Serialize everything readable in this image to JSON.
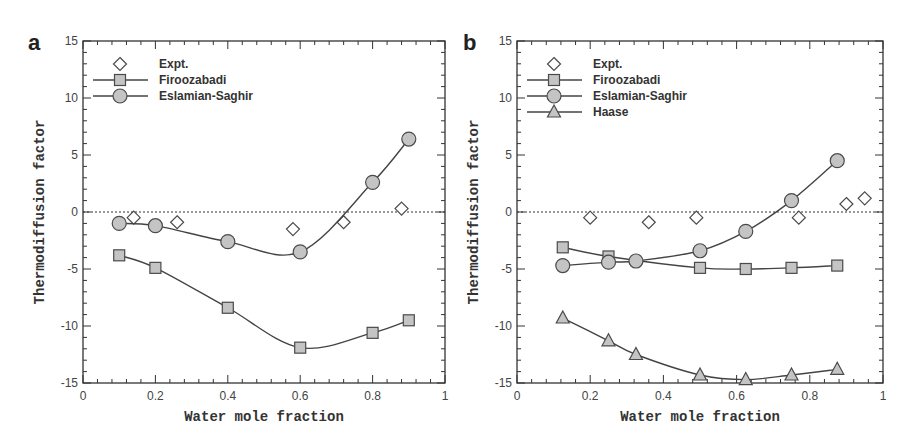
{
  "figure": {
    "panels": [
      {
        "label": "a",
        "xlabel": "Water mole fraction",
        "ylabel": "Thermodiffusion factor"
      },
      {
        "label": "b",
        "xlabel": "Water mole fraction",
        "ylabel": "Thermodiffusion factor"
      }
    ]
  },
  "style": {
    "axis_color": "#333333",
    "line_color": "#444444",
    "marker_fill": "#c4c4c4",
    "marker_stroke": "#4a4a4a",
    "zero_line_color": "#333333"
  },
  "chart_data": [
    {
      "type": "line",
      "panel": "a",
      "title": "",
      "xlabel": "Water mole fraction",
      "ylabel": "Thermodiffusion factor",
      "xlim": [
        0,
        1
      ],
      "ylim": [
        -15,
        15
      ],
      "xticks": [
        0,
        0.2,
        0.4,
        0.6,
        0.8,
        1
      ],
      "xtick_labels": [
        "0",
        "0.2",
        "0.4",
        "0.6",
        "0.8",
        "1"
      ],
      "yticks": [
        -15,
        -10,
        -5,
        0,
        5,
        10,
        15
      ],
      "ytick_labels": [
        "-15",
        "-10",
        "-5",
        "0",
        "5",
        "10",
        "15"
      ],
      "reference_line": {
        "y": 0,
        "style": "dotted"
      },
      "grid": false,
      "legend_position": "upper left",
      "series": [
        {
          "name": "Expt.",
          "marker": "diamond",
          "line": false,
          "x": [
            0.14,
            0.26,
            0.58,
            0.72,
            0.88
          ],
          "y": [
            -0.5,
            -0.9,
            -1.5,
            -0.9,
            0.3
          ]
        },
        {
          "name": "Firoozabadi",
          "marker": "square",
          "line": true,
          "x": [
            0.1,
            0.2,
            0.4,
            0.6,
            0.8,
            0.9
          ],
          "y": [
            -3.8,
            -4.9,
            -8.4,
            -11.9,
            -10.6,
            -9.5
          ]
        },
        {
          "name": "Eslamian-Saghir",
          "marker": "circle",
          "line": true,
          "x": [
            0.1,
            0.2,
            0.4,
            0.6,
            0.8,
            0.9
          ],
          "y": [
            -1.0,
            -1.2,
            -2.6,
            -3.5,
            2.6,
            6.4
          ]
        }
      ]
    },
    {
      "type": "line",
      "panel": "b",
      "title": "",
      "xlabel": "Water mole fraction",
      "ylabel": "Thermodiffusion factor",
      "xlim": [
        0,
        1
      ],
      "ylim": [
        -15,
        15
      ],
      "xticks": [
        0,
        0.2,
        0.4,
        0.6,
        0.8,
        1
      ],
      "xtick_labels": [
        "0",
        "0.2",
        "0.4",
        "0.6",
        "0.8",
        "1"
      ],
      "yticks": [
        -15,
        -10,
        -5,
        0,
        5,
        10,
        15
      ],
      "ytick_labels": [
        "-15",
        "-10",
        "-5",
        "0",
        "5",
        "10",
        "15"
      ],
      "reference_line": {
        "y": 0,
        "style": "dotted"
      },
      "grid": false,
      "legend_position": "upper left",
      "series": [
        {
          "name": "Expt.",
          "marker": "diamond",
          "line": false,
          "x": [
            0.2,
            0.36,
            0.49,
            0.77,
            0.9,
            0.95
          ],
          "y": [
            -0.5,
            -0.9,
            -0.5,
            -0.5,
            0.7,
            1.2
          ]
        },
        {
          "name": "Firoozabadi",
          "marker": "square",
          "line": true,
          "x": [
            0.125,
            0.25,
            0.5,
            0.625,
            0.75,
            0.875
          ],
          "y": [
            -3.1,
            -3.9,
            -4.9,
            -5.0,
            -4.9,
            -4.7
          ]
        },
        {
          "name": "Eslamian-Saghir",
          "marker": "circle",
          "line": true,
          "x": [
            0.125,
            0.25,
            0.325,
            0.5,
            0.625,
            0.75,
            0.875
          ],
          "y": [
            -4.7,
            -4.4,
            -4.3,
            -3.4,
            -1.7,
            1.0,
            4.5
          ]
        },
        {
          "name": "Haase",
          "marker": "triangle",
          "line": true,
          "x": [
            0.125,
            0.25,
            0.325,
            0.5,
            0.625,
            0.75,
            0.875
          ],
          "y": [
            -9.3,
            -11.3,
            -12.5,
            -14.3,
            -14.7,
            -14.3,
            -13.8
          ]
        }
      ]
    }
  ]
}
